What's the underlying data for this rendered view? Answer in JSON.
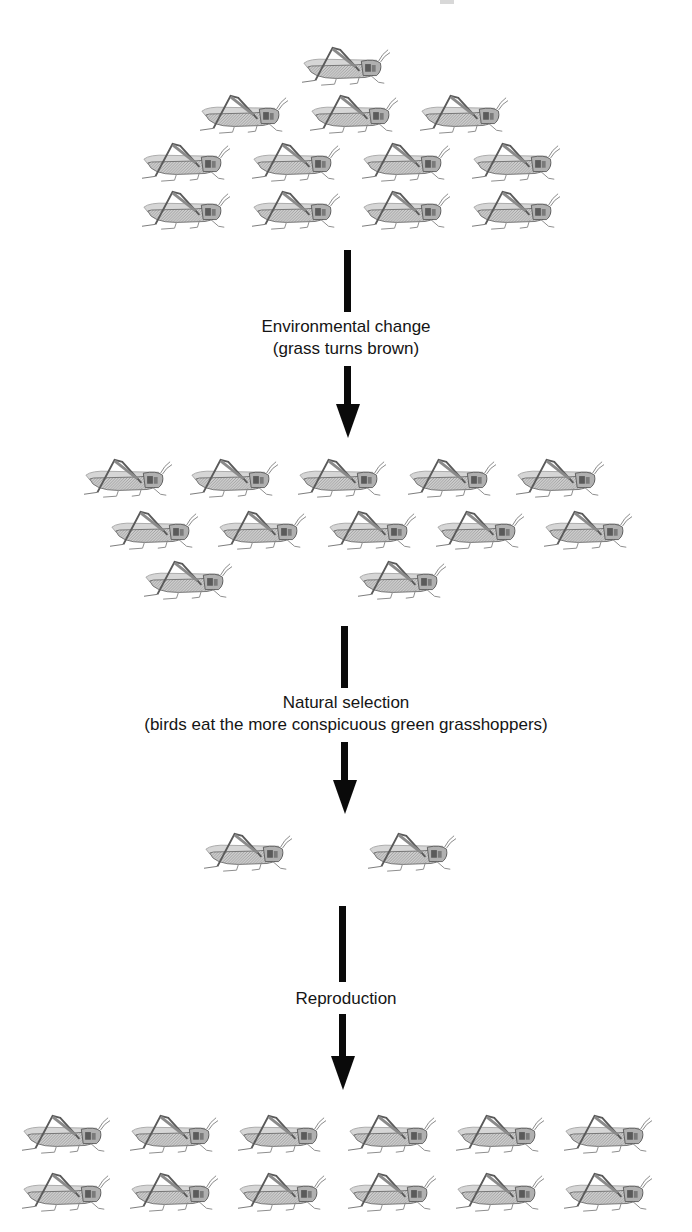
{
  "diagram": {
    "type": "flow-vertical",
    "stages": [
      {
        "id": "initial-population",
        "count": 13,
        "rows": [
          1,
          3,
          4,
          4
        ]
      },
      {
        "id": "after-environmental-change",
        "count": 12,
        "rows": [
          5,
          5,
          2
        ]
      },
      {
        "id": "after-natural-selection",
        "count": 2,
        "rows": [
          2
        ]
      },
      {
        "id": "after-reproduction",
        "count": 12,
        "rows": [
          6,
          6
        ]
      }
    ],
    "transitions": [
      {
        "title": "Environmental change",
        "subtitle": "(grass turns brown)"
      },
      {
        "title": "Natural selection",
        "subtitle": "(birds eat the more conspicuous green grasshoppers)"
      },
      {
        "title": "Reproduction",
        "subtitle": ""
      }
    ],
    "colors": {
      "arrow": "#0a0a0a",
      "text": "#151515",
      "background": "#ffffff"
    }
  },
  "hoppers": [
    {
      "x": 298,
      "y": 44
    },
    {
      "x": 196,
      "y": 92
    },
    {
      "x": 306,
      "y": 92
    },
    {
      "x": 416,
      "y": 92
    },
    {
      "x": 138,
      "y": 140
    },
    {
      "x": 248,
      "y": 140
    },
    {
      "x": 358,
      "y": 140
    },
    {
      "x": 468,
      "y": 140
    },
    {
      "x": 138,
      "y": 188
    },
    {
      "x": 248,
      "y": 188
    },
    {
      "x": 358,
      "y": 188
    },
    {
      "x": 468,
      "y": 188
    },
    {
      "x": 80,
      "y": 456
    },
    {
      "x": 186,
      "y": 456
    },
    {
      "x": 294,
      "y": 456
    },
    {
      "x": 404,
      "y": 456
    },
    {
      "x": 512,
      "y": 456
    },
    {
      "x": 106,
      "y": 508
    },
    {
      "x": 214,
      "y": 508
    },
    {
      "x": 324,
      "y": 508
    },
    {
      "x": 432,
      "y": 508
    },
    {
      "x": 540,
      "y": 508
    },
    {
      "x": 140,
      "y": 558
    },
    {
      "x": 354,
      "y": 558
    },
    {
      "x": 200,
      "y": 830
    },
    {
      "x": 364,
      "y": 830
    },
    {
      "x": 18,
      "y": 1112
    },
    {
      "x": 126,
      "y": 1112
    },
    {
      "x": 234,
      "y": 1112
    },
    {
      "x": 344,
      "y": 1112
    },
    {
      "x": 452,
      "y": 1112
    },
    {
      "x": 560,
      "y": 1112
    },
    {
      "x": 18,
      "y": 1170
    },
    {
      "x": 126,
      "y": 1170
    },
    {
      "x": 234,
      "y": 1170
    },
    {
      "x": 344,
      "y": 1170
    },
    {
      "x": 452,
      "y": 1170
    },
    {
      "x": 560,
      "y": 1170
    }
  ]
}
